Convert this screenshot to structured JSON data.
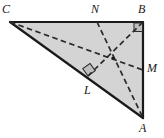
{
  "figure": {
    "kind": "geometry-diagram",
    "background_color": "#ffffff",
    "fill_color": "#d4d4d4",
    "stroke_color": "#1a1a1a",
    "dash_color": "#2b2b2b",
    "marker_fill_color": "#bfbfbf",
    "canvas": {
      "width": 164,
      "height": 138
    }
  },
  "points": {
    "C": {
      "label": "C",
      "x": 10,
      "y": 22,
      "label_x": 2,
      "label_y": 3
    },
    "B": {
      "label": "B",
      "x": 143,
      "y": 22,
      "label_x": 138,
      "label_y": 3
    },
    "A": {
      "label": "A",
      "x": 143,
      "y": 118,
      "label_x": 139,
      "label_y": 123
    },
    "M": {
      "label": "M",
      "x": 143,
      "y": 70,
      "label_x": 146,
      "label_y": 62
    },
    "N": {
      "label": "N",
      "x": 97,
      "y": 22,
      "label_x": 91,
      "label_y": 4
    },
    "L": {
      "label": "L",
      "x": 88,
      "y": 76,
      "label_x": 84,
      "label_y": 84
    },
    "G": {
      "label": "",
      "x": 113,
      "y": 58
    }
  },
  "edges": [
    {
      "name": "edge-CB",
      "from": "C",
      "to": "B",
      "style": "solid"
    },
    {
      "name": "edge-BA",
      "from": "B",
      "to": "A",
      "style": "solid"
    },
    {
      "name": "edge-AC",
      "from": "A",
      "to": "C",
      "style": "solid"
    }
  ],
  "cevians": [
    {
      "name": "cevian-C-to-M",
      "from": "C",
      "to": "M",
      "style": "dashed"
    },
    {
      "name": "cevian-N-to-A",
      "from": "N",
      "to": "A",
      "style": "dashed"
    },
    {
      "name": "cevian-B-to-L",
      "from": "B",
      "to": "L",
      "style": "dashed"
    }
  ],
  "right_angle_markers": [
    {
      "name": "right-angle-marker-B",
      "at": "B",
      "size": 9,
      "rotation_deg": 0
    },
    {
      "name": "right-angle-marker-L",
      "at": "L",
      "size": 9,
      "rotation_deg": -36
    }
  ],
  "labels": {
    "C": "C",
    "B": "B",
    "A": "A",
    "M": "M",
    "N": "N",
    "L": "L"
  }
}
